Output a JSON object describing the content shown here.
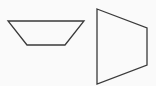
{
  "figure": {
    "background": "#fafafa",
    "stroke": "#3a3a3a",
    "shapes": [
      {
        "name": "trapezoid-horizontal",
        "points": "8,21 84,21 65,45 27,45"
      },
      {
        "name": "trapezoid-vertical",
        "points": "97,9 147,28 147,65 97,84"
      }
    ]
  }
}
